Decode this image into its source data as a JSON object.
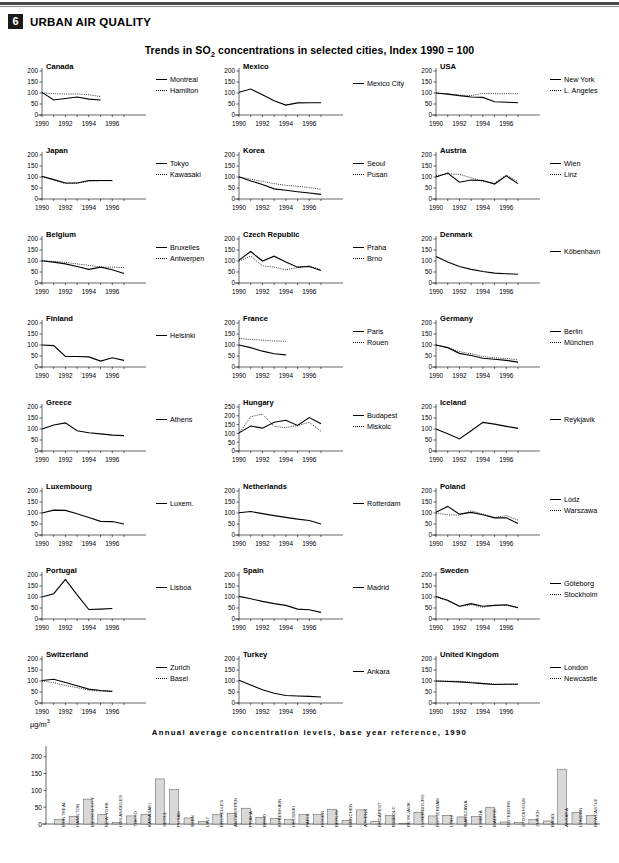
{
  "header": {
    "section_number": "6",
    "section_title": "URBAN AIR QUALITY",
    "chart_title_pre": "Trends in SO",
    "chart_title_sub": "2",
    "chart_title_post": " concentrations in selected cities, Index 1990 = 100"
  },
  "axis": {
    "yticks_200": [
      "200",
      "150",
      "100",
      "50",
      "0"
    ],
    "yticks_250": [
      "250",
      "200",
      "150",
      "100",
      "50",
      "0"
    ],
    "xticks": [
      "1990",
      "1992",
      "1994",
      "1996"
    ]
  },
  "bar_section": {
    "unit_pre": "µg/m",
    "unit_sup": "3",
    "title": "Annual average concentration levels, base year reference, 1990"
  },
  "chart_data": [
    {
      "type": "line",
      "title": "Canada",
      "ylim": [
        0,
        200
      ],
      "xlim": [
        1990,
        1997
      ],
      "x": [
        1990,
        1991,
        1992,
        1993,
        1994,
        1995
      ],
      "series": [
        {
          "name": "Montreal",
          "style": "solid",
          "values": [
            103,
            68,
            75,
            82,
            72,
            68
          ]
        },
        {
          "name": "Hamilton",
          "style": "dotted",
          "values": [
            100,
            97,
            95,
            96,
            92,
            84
          ]
        }
      ]
    },
    {
      "type": "line",
      "title": "Mexico",
      "ylim": [
        0,
        200
      ],
      "xlim": [
        1990,
        1997
      ],
      "x": [
        1990,
        1991,
        1992,
        1993,
        1994,
        1995,
        1996,
        1997
      ],
      "series": [
        {
          "name": "Mexico City",
          "style": "solid",
          "values": [
            103,
            118,
            92,
            65,
            45,
            55,
            56,
            56
          ]
        }
      ]
    },
    {
      "type": "line",
      "title": "USA",
      "ylim": [
        0,
        200
      ],
      "xlim": [
        1990,
        1997
      ],
      "x": [
        1990,
        1991,
        1992,
        1993,
        1994,
        1995,
        1996,
        1997
      ],
      "series": [
        {
          "name": "New York",
          "style": "solid",
          "values": [
            100,
            95,
            88,
            82,
            80,
            60,
            58,
            56
          ]
        },
        {
          "name": "L. Angeles",
          "style": "dotted",
          "values": [
            100,
            96,
            90,
            88,
            98,
            97,
            97,
            97
          ]
        }
      ]
    },
    {
      "type": "line",
      "title": "Japan",
      "ylim": [
        0,
        200
      ],
      "xlim": [
        1990,
        1997
      ],
      "x": [
        1990,
        1991,
        1992,
        1993,
        1994,
        1995,
        1996
      ],
      "series": [
        {
          "name": "Tokyo",
          "style": "solid",
          "values": [
            103,
            88,
            73,
            73,
            84,
            84,
            84
          ]
        },
        {
          "name": "Kawasaki",
          "style": "dotted",
          "values": [
            100,
            87,
            70,
            72,
            80,
            83,
            83
          ]
        }
      ]
    },
    {
      "type": "line",
      "title": "Korea",
      "ylim": [
        0,
        200
      ],
      "xlim": [
        1990,
        1997
      ],
      "x": [
        1990,
        1991,
        1992,
        1993,
        1994,
        1995,
        1996,
        1997
      ],
      "series": [
        {
          "name": "Seoul",
          "style": "solid",
          "values": [
            101,
            82,
            66,
            46,
            40,
            33,
            27,
            21
          ]
        },
        {
          "name": "Pusan",
          "style": "dotted",
          "values": [
            100,
            90,
            80,
            70,
            62,
            58,
            52,
            44
          ]
        }
      ]
    },
    {
      "type": "line",
      "title": "Austria",
      "ylim": [
        0,
        200
      ],
      "xlim": [
        1990,
        1997
      ],
      "x": [
        1990,
        1991,
        1992,
        1993,
        1994,
        1995,
        1996,
        1997
      ],
      "series": [
        {
          "name": "Wien",
          "style": "solid",
          "values": [
            100,
            118,
            76,
            86,
            84,
            68,
            105,
            70
          ]
        },
        {
          "name": "Linz",
          "style": "dotted",
          "values": [
            106,
            114,
            112,
            97,
            80,
            72,
            110,
            78
          ]
        }
      ]
    },
    {
      "type": "line",
      "title": "Belgium",
      "ylim": [
        0,
        200
      ],
      "xlim": [
        1990,
        1997
      ],
      "x": [
        1990,
        1991,
        1992,
        1993,
        1994,
        1995,
        1996,
        1997
      ],
      "series": [
        {
          "name": "Bruxelles",
          "style": "solid",
          "values": [
            101,
            95,
            87,
            75,
            62,
            72,
            60,
            43
          ]
        },
        {
          "name": "Antwerpen",
          "style": "dotted",
          "values": [
            100,
            98,
            94,
            87,
            80,
            73,
            72,
            70
          ]
        }
      ]
    },
    {
      "type": "line",
      "title": "Czech Republic",
      "ylim": [
        0,
        200
      ],
      "xlim": [
        1990,
        1997
      ],
      "x": [
        1990,
        1991,
        1992,
        1993,
        1994,
        1995,
        1996,
        1997
      ],
      "series": [
        {
          "name": "Praha",
          "style": "solid",
          "values": [
            104,
            143,
            100,
            122,
            95,
            72,
            75,
            57
          ]
        },
        {
          "name": "Brno",
          "style": "dotted",
          "values": [
            100,
            122,
            78,
            72,
            60,
            70,
            78,
            60
          ]
        }
      ]
    },
    {
      "type": "line",
      "title": "Denmark",
      "ylim": [
        0,
        200
      ],
      "xlim": [
        1990,
        1997
      ],
      "x": [
        1990,
        1991,
        1992,
        1993,
        1994,
        1995,
        1996,
        1997
      ],
      "series": [
        {
          "name": "Köbenhavn",
          "style": "solid",
          "values": [
            120,
            95,
            75,
            62,
            52,
            45,
            42,
            40
          ]
        }
      ]
    },
    {
      "type": "line",
      "title": "Finland",
      "ylim": [
        0,
        200
      ],
      "xlim": [
        1990,
        1997
      ],
      "x": [
        1990,
        1991,
        1992,
        1993,
        1994,
        1995,
        1996,
        1997
      ],
      "series": [
        {
          "name": "Helsinki",
          "style": "solid",
          "values": [
            100,
            97,
            48,
            48,
            46,
            27,
            42,
            30
          ]
        }
      ]
    },
    {
      "type": "line",
      "title": "France",
      "ylim": [
        0,
        200
      ],
      "xlim": [
        1990,
        1997
      ],
      "x": [
        1990,
        1991,
        1992,
        1993,
        1994
      ],
      "series": [
        {
          "name": "Paris",
          "style": "solid",
          "values": [
            100,
            88,
            72,
            60,
            55
          ]
        },
        {
          "name": "Rouen",
          "style": "dotted",
          "values": [
            130,
            125,
            122,
            118,
            117
          ]
        }
      ]
    },
    {
      "type": "line",
      "title": "Germany",
      "ylim": [
        0,
        200
      ],
      "xlim": [
        1990,
        1997
      ],
      "x": [
        1990,
        1991,
        1992,
        1993,
        1994,
        1995,
        1996,
        1997
      ],
      "series": [
        {
          "name": "Berlin",
          "style": "solid",
          "values": [
            100,
            88,
            62,
            52,
            40,
            35,
            30,
            22
          ]
        },
        {
          "name": "München",
          "style": "dotted",
          "values": [
            100,
            88,
            70,
            60,
            48,
            42,
            38,
            33
          ]
        }
      ]
    },
    {
      "type": "line",
      "title": "Greece",
      "ylim": [
        0,
        200
      ],
      "xlim": [
        1990,
        1997
      ],
      "x": [
        1990,
        1991,
        1992,
        1993,
        1994,
        1995,
        1996,
        1997
      ],
      "series": [
        {
          "name": "Athens",
          "style": "solid",
          "values": [
            100,
            118,
            128,
            92,
            83,
            78,
            72,
            70
          ]
        }
      ]
    },
    {
      "type": "line",
      "title": "Hungary",
      "ylim": [
        0,
        250
      ],
      "xlim": [
        1990,
        1997
      ],
      "x": [
        1990,
        1991,
        1992,
        1993,
        1994,
        1995,
        1996,
        1997
      ],
      "series": [
        {
          "name": "Budapest",
          "style": "solid",
          "values": [
            103,
            142,
            130,
            163,
            175,
            145,
            190,
            155
          ]
        },
        {
          "name": "Miskolc",
          "style": "dotted",
          "values": [
            100,
            195,
            210,
            140,
            133,
            145,
            163,
            112
          ]
        }
      ]
    },
    {
      "type": "line",
      "title": "Iceland",
      "ylim": [
        0,
        200
      ],
      "xlim": [
        1990,
        1997
      ],
      "x": [
        1990,
        1991,
        1992,
        1993,
        1994,
        1995,
        1996,
        1997
      ],
      "series": [
        {
          "name": "Reykjavik",
          "style": "solid",
          "values": [
            100,
            78,
            55,
            92,
            130,
            122,
            112,
            103
          ]
        }
      ]
    },
    {
      "type": "line",
      "title": "Luxembourg",
      "ylim": [
        0,
        200
      ],
      "xlim": [
        1990,
        1997
      ],
      "x": [
        1990,
        1991,
        1992,
        1993,
        1994,
        1995,
        1996,
        1997
      ],
      "series": [
        {
          "name": "Luxem.",
          "style": "solid",
          "values": [
            100,
            113,
            112,
            97,
            80,
            62,
            61,
            50
          ]
        }
      ]
    },
    {
      "type": "line",
      "title": "Netherlands",
      "ylim": [
        0,
        200
      ],
      "xlim": [
        1990,
        1997
      ],
      "x": [
        1990,
        1991,
        1992,
        1993,
        1994,
        1995,
        1996,
        1997
      ],
      "series": [
        {
          "name": "Rotterdam",
          "style": "solid",
          "values": [
            101,
            107,
            97,
            88,
            80,
            72,
            66,
            50
          ]
        }
      ]
    },
    {
      "type": "line",
      "title": "Poland",
      "ylim": [
        0,
        200
      ],
      "xlim": [
        1990,
        1997
      ],
      "x": [
        1990,
        1991,
        1992,
        1993,
        1994,
        1995,
        1996,
        1997
      ],
      "series": [
        {
          "name": "Lódz",
          "style": "solid",
          "values": [
            103,
            130,
            95,
            103,
            92,
            78,
            78,
            52
          ]
        },
        {
          "name": "Warszawa",
          "style": "dotted",
          "values": [
            100,
            92,
            90,
            110,
            95,
            80,
            88,
            68
          ]
        }
      ]
    },
    {
      "type": "line",
      "title": "Portugal",
      "ylim": [
        0,
        200
      ],
      "xlim": [
        1990,
        1997
      ],
      "x": [
        1990,
        1991,
        1992,
        1993,
        1994,
        1995,
        1996
      ],
      "series": [
        {
          "name": "Lisboa",
          "style": "solid",
          "values": [
            100,
            115,
            180,
            110,
            43,
            45,
            48
          ]
        }
      ]
    },
    {
      "type": "line",
      "title": "Spain",
      "ylim": [
        0,
        200
      ],
      "xlim": [
        1990,
        1997
      ],
      "x": [
        1990,
        1991,
        1992,
        1993,
        1994,
        1995,
        1996,
        1997
      ],
      "series": [
        {
          "name": "Madrid",
          "style": "solid",
          "values": [
            103,
            92,
            80,
            70,
            62,
            45,
            42,
            30
          ]
        }
      ]
    },
    {
      "type": "line",
      "title": "Sweden",
      "ylim": [
        0,
        200
      ],
      "xlim": [
        1990,
        1997
      ],
      "x": [
        1990,
        1991,
        1992,
        1993,
        1994,
        1995,
        1996,
        1997
      ],
      "series": [
        {
          "name": "Göteborg",
          "style": "solid",
          "values": [
            102,
            85,
            58,
            70,
            58,
            62,
            65,
            51
          ]
        },
        {
          "name": "Stockholm",
          "style": "dotted",
          "values": [
            100,
            82,
            57,
            65,
            53,
            62,
            62,
            52
          ]
        }
      ]
    },
    {
      "type": "line",
      "title": "Switzerland",
      "ylim": [
        0,
        200
      ],
      "xlim": [
        1990,
        1997
      ],
      "x": [
        1990,
        1991,
        1992,
        1993,
        1994,
        1995,
        1996
      ],
      "series": [
        {
          "name": "Zurich",
          "style": "solid",
          "values": [
            102,
            108,
            93,
            78,
            63,
            57,
            53
          ]
        },
        {
          "name": "Basel",
          "style": "dotted",
          "values": [
            100,
            92,
            80,
            70,
            58,
            54,
            52
          ]
        }
      ]
    },
    {
      "type": "line",
      "title": "Turkey",
      "ylim": [
        0,
        200
      ],
      "xlim": [
        1990,
        1997
      ],
      "x": [
        1990,
        1991,
        1992,
        1993,
        1994,
        1995,
        1996,
        1997
      ],
      "series": [
        {
          "name": "Ankara",
          "style": "solid",
          "values": [
            103,
            82,
            60,
            44,
            34,
            32,
            30,
            27
          ]
        }
      ]
    },
    {
      "type": "line",
      "title": "United Kingdom",
      "ylim": [
        0,
        200
      ],
      "xlim": [
        1990,
        1997
      ],
      "x": [
        1990,
        1991,
        1992,
        1993,
        1994,
        1995,
        1996,
        1997
      ],
      "series": [
        {
          "name": "London",
          "style": "solid",
          "values": [
            100,
            98,
            96,
            92,
            88,
            84,
            85,
            85
          ]
        },
        {
          "name": "Newcastle",
          "style": "dotted",
          "values": [
            100,
            100,
            98,
            95,
            90,
            86,
            86,
            86
          ]
        }
      ]
    },
    {
      "type": "bar",
      "title": "Annual average concentration levels, base year reference, 1990",
      "ylabel": "µg/m3",
      "ylim": [
        0,
        220
      ],
      "yticks": [
        0,
        50,
        100,
        150,
        200
      ],
      "categories": [
        "MONTREAL",
        "HAMILTON",
        "MEXICO CITY",
        "NEW YORK",
        "LOS ANGELES",
        "TOKYO",
        "KAWASAKI",
        "SEOUL",
        "PUSAN",
        "WIEN",
        "LINZ",
        "BRUXELLES",
        "ANTWERPEN",
        "PRAHA",
        "BRNO",
        "KÖBENHAVN",
        "HELSINKI",
        "PARIS",
        "ROUEN",
        "BERLIN",
        "MÜNCHEN",
        "ATHENS",
        "BUDAPEST",
        "MISKOLC",
        "REYKJAVIK",
        "LUXEMBOURG",
        "ROTTERDAM",
        "LÓDZ",
        "WARSZAWA",
        "LISBOA",
        "MADRID",
        "GÖTEBORG",
        "STOCKHOLM",
        "ZURICH",
        "BASEL",
        "ANKARA",
        "LONDON",
        "NEWCASTLE"
      ],
      "values": [
        14,
        23,
        74,
        28,
        5,
        24,
        28,
        134,
        102,
        18,
        8,
        28,
        32,
        47,
        20,
        16,
        13,
        28,
        28,
        44,
        11,
        42,
        8,
        25,
        2,
        35,
        24,
        26,
        21,
        23,
        50,
        6,
        5,
        13,
        9,
        163,
        34,
        25
      ]
    }
  ]
}
